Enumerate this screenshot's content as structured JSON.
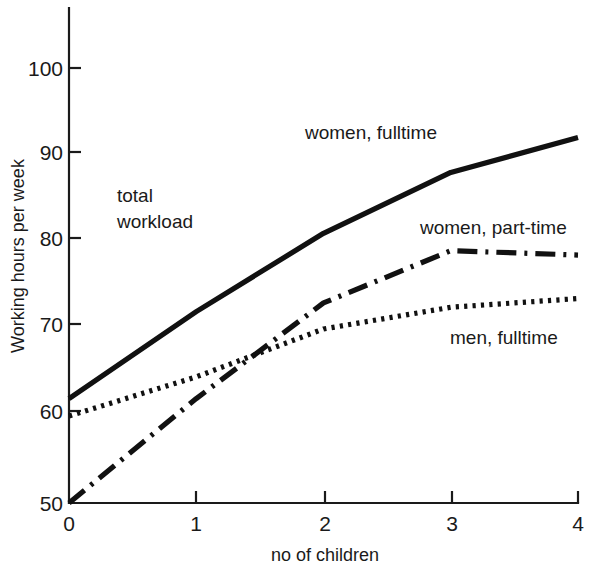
{
  "chart_data": {
    "type": "line",
    "title": "",
    "xlabel": "no of children",
    "ylabel": "Working hours per week",
    "x": [
      0,
      1,
      2,
      3,
      4
    ],
    "xlim": [
      0,
      4
    ],
    "ylim": [
      50,
      104
    ],
    "xticks": [
      "0",
      "1",
      "2",
      "3",
      "4"
    ],
    "yticks": [
      "50",
      "60",
      "70",
      "80",
      "90",
      "100"
    ],
    "grid": false,
    "legend_position": "inline-annotations",
    "series": [
      {
        "name": "women, fulltime",
        "style": "solid",
        "values": [
          62,
          72,
          81,
          88,
          92
        ]
      },
      {
        "name": "women, part-time",
        "style": "dash-dot",
        "values": [
          50,
          62,
          73,
          79,
          78.5
        ]
      },
      {
        "name": "men, fulltime",
        "style": "dotted",
        "values": [
          60,
          64.5,
          70,
          72.5,
          73.5
        ]
      }
    ],
    "annotations": [
      {
        "text_line1": "total",
        "text_line2": "workload"
      }
    ]
  },
  "labels": {
    "annotation_total": "total",
    "annotation_workload": "workload",
    "series_women_fulltime": "women, fulltime",
    "series_women_parttime": "women, part-time",
    "series_men_fulltime": "men, fulltime",
    "axis_x_title": "no of children",
    "axis_y_title": "Working hours per week",
    "ytick_100": "100",
    "ytick_90": "90",
    "ytick_80": "80",
    "ytick_70": "70",
    "ytick_60": "60",
    "ytick_50": "50",
    "xtick_0": "0",
    "xtick_1": "1",
    "xtick_2": "2",
    "xtick_3": "3",
    "xtick_4": "4"
  },
  "colors": {
    "ink": "#1a1a1a",
    "line": "#111111",
    "background": "#ffffff"
  }
}
